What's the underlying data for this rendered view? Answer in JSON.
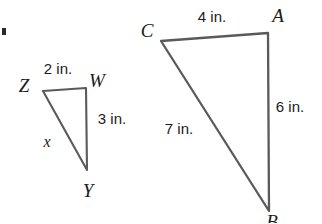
{
  "figure": {
    "background_color": "#ffffff",
    "stroke_color": "#555555",
    "text_color": "#1b1b1b"
  },
  "small_triangle": {
    "name": "triangle-ZWY",
    "vertices": [
      {
        "label": "Z",
        "x": 24,
        "y": 85,
        "point_x": 43,
        "point_y": 91
      },
      {
        "label": "W",
        "x": 97,
        "y": 80,
        "point_x": 86,
        "point_y": 88
      },
      {
        "label": "Y",
        "x": 88,
        "y": 190,
        "point_x": 87,
        "point_y": 170
      }
    ],
    "sides": [
      {
        "name": "ZW",
        "label": "2 in.",
        "x": 58,
        "y": 68
      },
      {
        "name": "WY",
        "label": "3 in.",
        "x": 112,
        "y": 118
      },
      {
        "name": "ZY",
        "label": "x",
        "x": 47,
        "y": 142
      }
    ]
  },
  "large_triangle": {
    "name": "triangle-CAB",
    "vertices": [
      {
        "label": "C",
        "x": 147,
        "y": 30,
        "point_x": 161,
        "point_y": 41
      },
      {
        "label": "A",
        "x": 278,
        "y": 15,
        "point_x": 268,
        "point_y": 33
      },
      {
        "label": "B",
        "x": 272,
        "y": 221,
        "point_x": 269,
        "point_y": 211
      }
    ],
    "sides": [
      {
        "name": "CA",
        "label": "4 in.",
        "x": 212,
        "y": 16
      },
      {
        "name": "AB",
        "label": "6 in.",
        "x": 290,
        "y": 106
      },
      {
        "name": "CB",
        "label": "7 in.",
        "x": 179,
        "y": 128
      }
    ]
  },
  "corner_mark": {
    "name": "page-edge-mark",
    "x": 3,
    "y": 31
  }
}
